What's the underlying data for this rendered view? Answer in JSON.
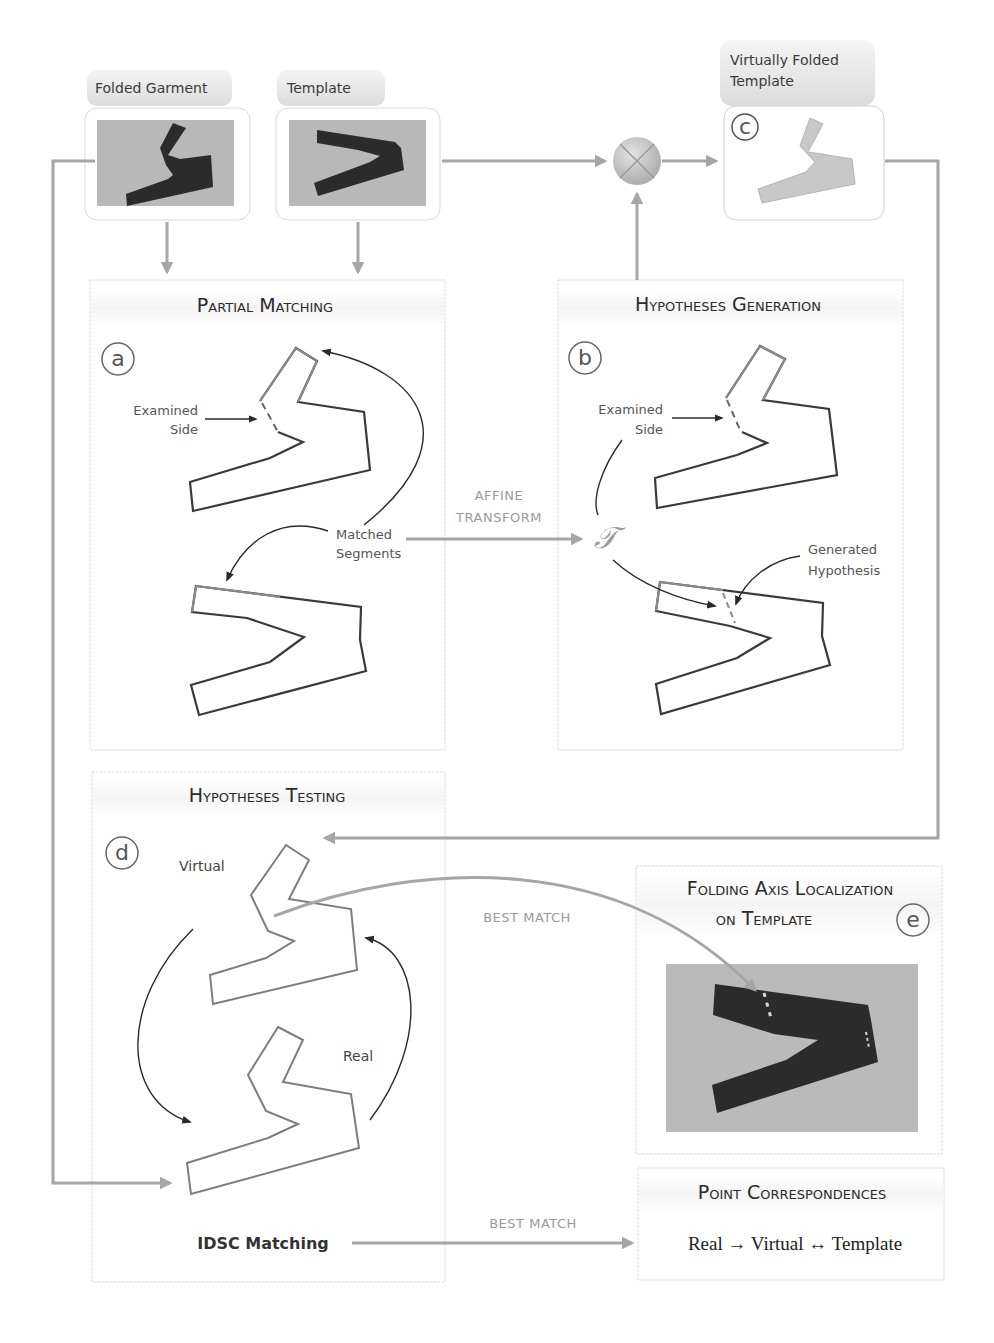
{
  "inputs": {
    "folded_garment": {
      "label": "Folded Garment"
    },
    "template": {
      "label": "Template"
    },
    "virtually_folded_template": {
      "label_line1": "Virtually Folded",
      "label_line2": "Template",
      "marker": "c"
    }
  },
  "panels": {
    "partial_matching": {
      "title": "Partial Matching",
      "marker": "a",
      "examined_side_line1": "Examined",
      "examined_side_line2": "Side",
      "matched_segments_line1": "Matched",
      "matched_segments_line2": "Segments"
    },
    "hypotheses_generation": {
      "title": "Hypotheses Generation",
      "marker": "b",
      "examined_side_line1": "Examined",
      "examined_side_line2": "Side",
      "generated_hypothesis_line1": "Generated",
      "generated_hypothesis_line2": "Hypothesis",
      "transform_symbol": "𝒯"
    },
    "hypotheses_testing": {
      "title": "Hypotheses Testing",
      "marker": "d",
      "virtual_label": "Virtual",
      "real_label": "Real",
      "method_label": "IDSC Matching"
    },
    "folding_axis_localization": {
      "title_line1": "Folding Axis Localization",
      "title_line2": "on Template",
      "marker": "e"
    },
    "point_correspondences": {
      "title": "Point Correspondences",
      "formula": "Real → Virtual ↔ Template"
    }
  },
  "connectors": {
    "affine_transform_line1": "AFFINE",
    "affine_transform_line2": "TRANSFORM",
    "best_match_upper": "BEST MATCH",
    "best_match_lower": "BEST MATCH"
  },
  "colors": {
    "connector": "#a6a6a6",
    "outline_dark": "#3a3a3a",
    "outline_light": "#8c8c8c",
    "garment": "#2c2c2c",
    "photo_bg": "#b9b9b9",
    "label_header_bg": "#e4e4e4"
  }
}
